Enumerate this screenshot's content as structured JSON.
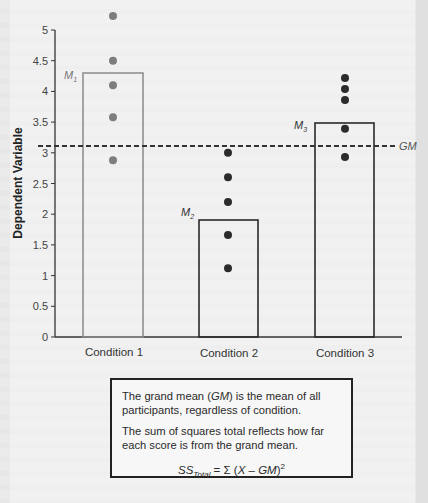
{
  "chart_data": {
    "type": "bar",
    "title": "",
    "xlabel": "",
    "ylabel": "Dependent Variable",
    "ylim": [
      0,
      5
    ],
    "yticks": [
      0,
      0.5,
      1,
      1.5,
      2,
      2.5,
      3,
      3.5,
      4,
      4.5,
      5
    ],
    "ytick_labels": [
      "0",
      "0.5",
      "1",
      "1.5",
      "2",
      "2.5",
      "3",
      "3.5",
      "4",
      "4.5",
      "5"
    ],
    "grid": false,
    "categories": [
      "Condition 1",
      "Condition 2",
      "Condition 3"
    ],
    "series": [
      {
        "name": "Condition means",
        "values": [
          4.3,
          1.9,
          3.5
        ],
        "labels": [
          "M1",
          "M2",
          "M3"
        ]
      }
    ],
    "scatter_points": [
      {
        "category": "Condition 1",
        "values": [
          5.23,
          4.5,
          4.1,
          3.58,
          2.88
        ]
      },
      {
        "category": "Condition 2",
        "values": [
          3.0,
          2.6,
          2.2,
          1.66,
          1.12
        ]
      },
      {
        "category": "Condition 3",
        "values": [
          4.22,
          4.04,
          3.86,
          3.39,
          2.93
        ]
      }
    ],
    "reference_lines": [
      {
        "label": "GM",
        "value": 3.1,
        "style": "dashed"
      }
    ],
    "annotations": [
      "M1",
      "M2",
      "M3",
      "GM"
    ]
  },
  "axis": {
    "ylabel": "Dependent Variable",
    "ticks": [
      "0",
      "0.5",
      "1",
      "1.5",
      "2",
      "2.5",
      "3",
      "3.5",
      "4",
      "4.5",
      "5"
    ],
    "categories": [
      "Condition 1",
      "Condition 2",
      "Condition 3"
    ]
  },
  "labels": {
    "m1": "M",
    "m1_sub": "1",
    "m2": "M",
    "m2_sub": "2",
    "m3": "M",
    "m3_sub": "3",
    "gm": "GM"
  },
  "note": {
    "p1_a": "The grand mean (",
    "p1_gm": "GM",
    "p1_b": ") is the mean of all participants, regardless of condition.",
    "p2": "The sum of squares total reflects how far each score is from the grand mean.",
    "formula_ss": "SS",
    "formula_sub": "Total",
    "formula_rest_a": " = Σ (",
    "formula_x": "X",
    "formula_minus": " – ",
    "formula_gm": "GM",
    "formula_close": ")",
    "formula_sup": "2"
  },
  "colors": {
    "bar1_stroke": "#8a8a8a",
    "bar_stroke": "#2a2a2a",
    "dot1": "#7d7d7d",
    "dot": "#2b2b2b",
    "axis": "#333333"
  }
}
